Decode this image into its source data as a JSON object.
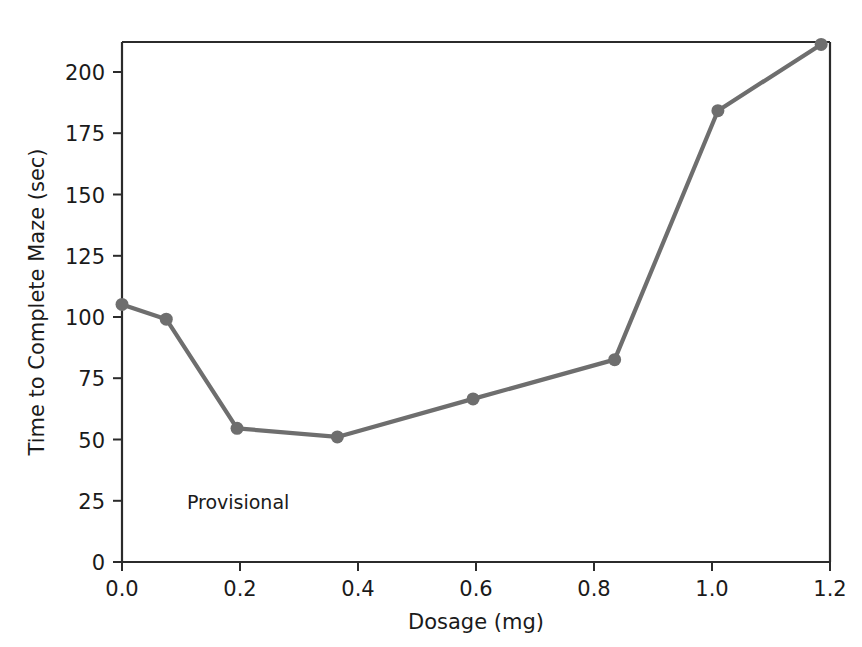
{
  "chart_data": {
    "type": "line",
    "title": "",
    "xlabel": "Dosage (mg)",
    "ylabel": "Time to Complete Maze (sec)",
    "xlim": [
      0.0,
      1.2
    ],
    "ylim": [
      0,
      212
    ],
    "grid": false,
    "legend": null,
    "xticks": [
      "0.0",
      "0.2",
      "0.4",
      "0.6",
      "0.8",
      "1.0",
      "1.2"
    ],
    "xtick_values": [
      0.0,
      0.2,
      0.4,
      0.6,
      0.8,
      1.0,
      1.2
    ],
    "yticks": [
      "0",
      "25",
      "50",
      "75",
      "100",
      "125",
      "150",
      "175",
      "200"
    ],
    "ytick_values": [
      0,
      25,
      50,
      75,
      100,
      125,
      150,
      175,
      200
    ],
    "x": [
      0.0,
      0.075,
      0.195,
      0.365,
      0.595,
      0.835,
      1.01,
      1.185
    ],
    "values": [
      105,
      99,
      54.5,
      51,
      66.5,
      82.5,
      184,
      211
    ],
    "series": [
      {
        "name": "Time to Complete Maze",
        "x": [
          0.0,
          0.075,
          0.195,
          0.365,
          0.595,
          0.835,
          1.01,
          1.185
        ],
        "values": [
          105,
          99,
          54.5,
          51,
          66.5,
          82.5,
          184,
          211
        ],
        "color": "#6e6e6e",
        "marker": "circle",
        "marker_size": 13
      }
    ],
    "annotations": [
      {
        "text": "Provisional",
        "x": 0.11,
        "y": 21.5
      }
    ],
    "colors": {
      "line": "#6e6e6e",
      "marker": "#6e6e6e",
      "axis": "#2b2b2b",
      "text": "#1a1a1a",
      "background": "#ffffff"
    }
  }
}
